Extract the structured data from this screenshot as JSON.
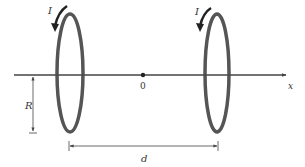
{
  "diagram": {
    "labels": {
      "current_left": "I",
      "current_right": "I",
      "axis": "x",
      "origin": "0",
      "radius": "R",
      "separation": "d"
    },
    "colors": {
      "coil": "#555555",
      "line": "#444444",
      "text": "#333333",
      "background": "#ffffff"
    },
    "elements": {
      "coils": [
        {
          "name": "left-coil",
          "cx": 70,
          "cy": 73,
          "rx": 13,
          "ry": 59
        },
        {
          "name": "right-coil",
          "cx": 217,
          "cy": 73,
          "rx": 12,
          "ry": 59
        }
      ],
      "axis": {
        "x1": 14,
        "x2": 288,
        "y": 75
      },
      "origin_point": {
        "x": 143,
        "y": 75
      },
      "radius_dimension": {
        "x": 33,
        "y1": 76,
        "y2": 133
      },
      "separation_dimension": {
        "y": 146,
        "x1": 69,
        "x2": 218
      }
    }
  }
}
